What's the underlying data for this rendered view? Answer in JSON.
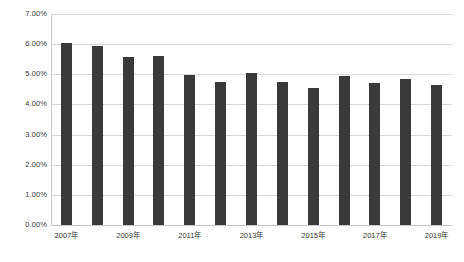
{
  "chart_data": {
    "type": "bar",
    "title": "",
    "subtitle": "",
    "xlabel": "",
    "ylabel": "",
    "categories": [
      "2007年",
      "2008年",
      "2009年",
      "2010年",
      "2011年",
      "2012年",
      "2013年",
      "2014年",
      "2015年",
      "2016年",
      "2017年",
      "2018年",
      "2019年"
    ],
    "values": [
      6.05,
      5.93,
      5.57,
      5.62,
      4.98,
      4.74,
      5.04,
      4.75,
      4.53,
      4.94,
      4.71,
      4.85,
      4.66
    ],
    "value_suffix": "%",
    "ylim": [
      0,
      7
    ],
    "ytick_labels": [
      "7.00%",
      "6.00%",
      "5.00%",
      "4.00%",
      "3.00%",
      "2.00%",
      "1.00%",
      "0.00%"
    ],
    "ytick_values": [
      7,
      6,
      5,
      4,
      3,
      2,
      1,
      0
    ],
    "xtick_labels": [
      "2007年",
      "2009年",
      "2011年",
      "2013年",
      "2015年",
      "2017年",
      "2019年"
    ],
    "xtick_indices": [
      0,
      2,
      4,
      6,
      8,
      10,
      12
    ],
    "grid": true,
    "legend": false,
    "legend_position": "none",
    "series_color": "#3a3a3a",
    "gridline_color": "#d9d9d9",
    "background_color": "#ffffff",
    "axis_color": "#c8c8c8"
  }
}
